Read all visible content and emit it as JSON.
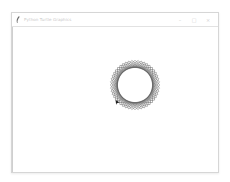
{
  "window": {
    "title": "Python Turtle Graphics",
    "icon": "feather-icon",
    "controls": [
      {
        "name": "minimize",
        "glyph": "–"
      },
      {
        "name": "maximize",
        "glyph": "□"
      },
      {
        "name": "close",
        "glyph": "×"
      }
    ]
  },
  "canvas": {
    "background": "#ffffff",
    "drawing": {
      "shape": "rotated-squares-spirograph",
      "center": [
        134,
        84
      ],
      "square_count": 12,
      "stroke_color": "#555555",
      "turtle_cursor": "arrow-icon"
    }
  },
  "caption": ""
}
